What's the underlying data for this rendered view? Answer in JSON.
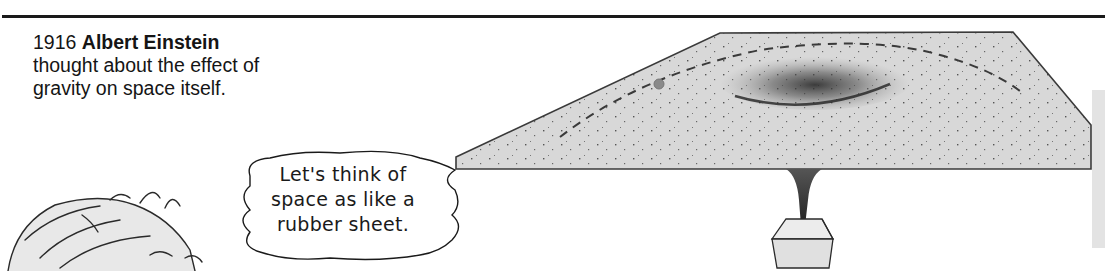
{
  "caption": {
    "year": "1916",
    "name": "Albert Einstein",
    "line2": "thought about the effect of",
    "line3": "gravity on space itself."
  },
  "speech_bubble": {
    "lines": [
      "Let's think of",
      "space as like a",
      "rubber sheet."
    ]
  },
  "illustration": {
    "subject": "rubber-sheet",
    "elements": [
      "dashed-orbit-path",
      "small-ball",
      "depression",
      "weight-block",
      "einstein-figure"
    ]
  },
  "colors": {
    "rule": "#1a1a1a",
    "sheet_fill": "#d9d9d9",
    "sheet_edge": "#3a3a3a",
    "ball": "#8a8a8a",
    "strip": "#e3e3e3"
  }
}
